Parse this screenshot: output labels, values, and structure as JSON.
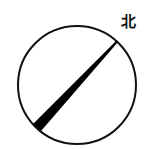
{
  "diagram": {
    "direction_label": "北",
    "circle": {
      "cx": 77,
      "cy": 85,
      "r": 59,
      "stroke": "#111111"
    },
    "pointer": {
      "tip": [
        117,
        41
      ],
      "base": [
        36,
        128
      ],
      "color": "#000000",
      "description": "tapered shadow line from lower-left (thick) to upper-right (thin)"
    }
  }
}
